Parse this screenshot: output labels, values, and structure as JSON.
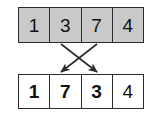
{
  "diagram": {
    "colors": {
      "top_row_fill": "#c9c9c9",
      "bottom_row_fill": "#ffffff",
      "border": "#2b2b2b",
      "text": "#111111",
      "arrow": "#2b2b2b"
    },
    "top_row": {
      "name": "before-array",
      "cells": [
        {
          "value": "1",
          "weight": "normal"
        },
        {
          "value": "3",
          "weight": "normal"
        },
        {
          "value": "7",
          "weight": "normal"
        },
        {
          "value": "4",
          "weight": "normal"
        }
      ]
    },
    "bottom_row": {
      "name": "after-array",
      "cells": [
        {
          "value": "1",
          "weight": "bold"
        },
        {
          "value": "7",
          "weight": "bold"
        },
        {
          "value": "3",
          "weight": "bold"
        },
        {
          "value": "4",
          "weight": "normal"
        }
      ]
    },
    "arrows": [
      {
        "name": "swap-arrow-3-to-position-3",
        "from_index": 1,
        "to_index": 2,
        "from_label": "3",
        "to_label": "3",
        "x1": 61,
        "y1": 44,
        "x2": 97,
        "y2": 72
      },
      {
        "name": "swap-arrow-7-to-position-2",
        "from_index": 2,
        "to_index": 1,
        "from_label": "7",
        "to_label": "7",
        "x1": 97,
        "y1": 44,
        "x2": 61,
        "y2": 72
      }
    ]
  }
}
